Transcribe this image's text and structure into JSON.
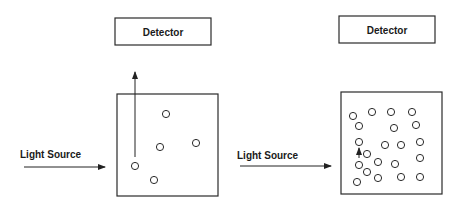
{
  "panels": [
    {
      "id": "sparse",
      "detector": {
        "label": "Detector",
        "x": 115,
        "y": 18,
        "w": 96,
        "h": 27
      },
      "sample_box": {
        "x": 117,
        "y": 94,
        "w": 101,
        "h": 102
      },
      "light_source": {
        "label": "Light Source",
        "text_x": 20,
        "text_y": 158,
        "arrow_x1": 24,
        "arrow_x2": 105,
        "arrow_y": 167
      },
      "scatter_arrow": {
        "x": 135,
        "y1": 157,
        "y2": 72
      },
      "particles": [
        [
          166,
          114
        ],
        [
          160,
          147
        ],
        [
          196,
          143
        ],
        [
          135,
          166
        ],
        [
          154,
          180
        ]
      ]
    },
    {
      "id": "dense",
      "detector": {
        "label": "Detector",
        "x": 339,
        "y": 16,
        "w": 96,
        "h": 27
      },
      "sample_box": {
        "x": 341,
        "y": 92,
        "w": 101,
        "h": 102
      },
      "light_source": {
        "label": "Light Source",
        "text_x": 237,
        "text_y": 159,
        "arrow_x1": 240,
        "arrow_x2": 331,
        "arrow_y": 166
      },
      "scatter_arrow": {
        "x": 359,
        "y1": 158,
        "y2": 148
      },
      "particles": [
        [
          353,
          116
        ],
        [
          372,
          112
        ],
        [
          391,
          112
        ],
        [
          412,
          112
        ],
        [
          359,
          126
        ],
        [
          394,
          128
        ],
        [
          416,
          125
        ],
        [
          359,
          142
        ],
        [
          385,
          145
        ],
        [
          401,
          145
        ],
        [
          420,
          142
        ],
        [
          367,
          154
        ],
        [
          420,
          158
        ],
        [
          359,
          165
        ],
        [
          378,
          162
        ],
        [
          395,
          164
        ],
        [
          367,
          172
        ],
        [
          357,
          182
        ],
        [
          378,
          178
        ],
        [
          401,
          177
        ],
        [
          420,
          177
        ]
      ]
    }
  ],
  "particle_radius": 3.6
}
